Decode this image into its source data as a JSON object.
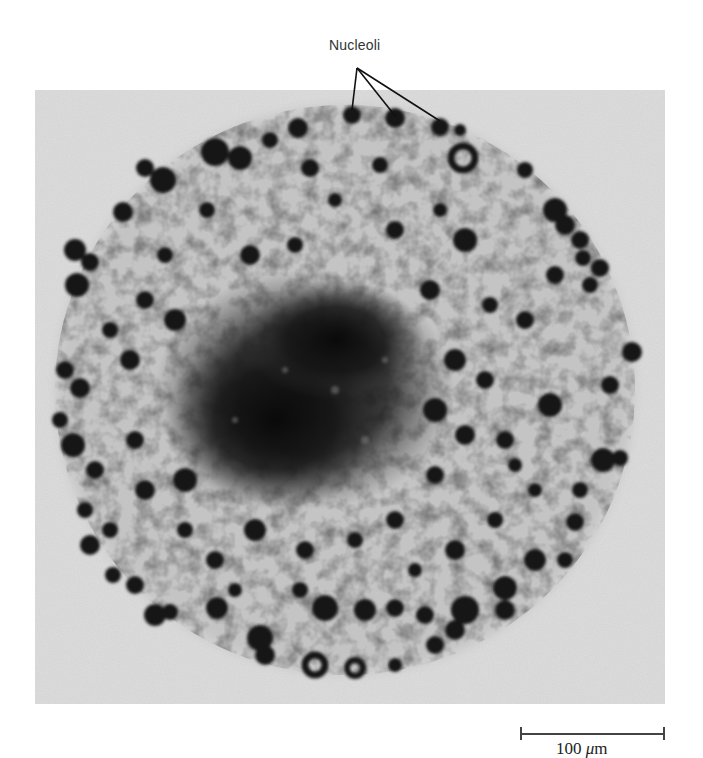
{
  "figure": {
    "label": "Nucleoli",
    "scale_bar": {
      "value": "100",
      "unit_symbol": "μ",
      "unit_suffix": "m",
      "full_text": "100 μm"
    },
    "colors": {
      "background": "#ffffff",
      "photo_background": "#dcdcdc",
      "cytoplasm": "#bdbdbd",
      "nucleolus_dark": "#1a1a1a",
      "center_mass": "#0d0d0d"
    }
  }
}
